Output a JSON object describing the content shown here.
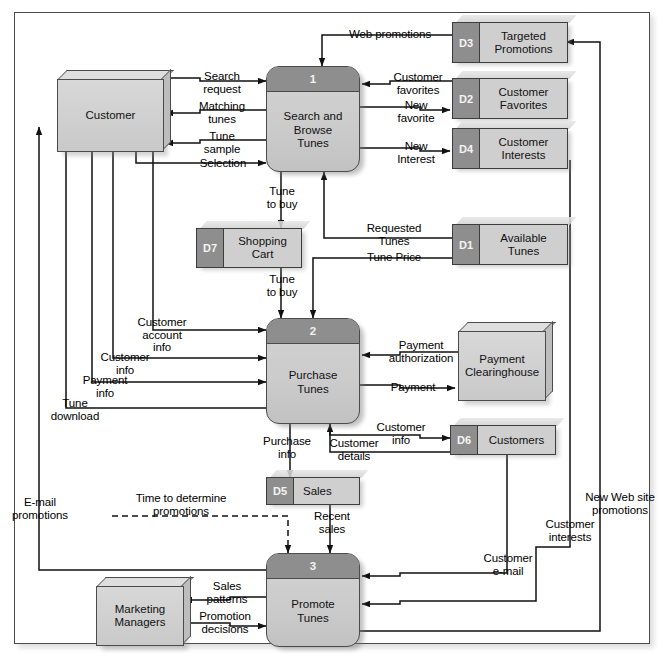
{
  "diagram": {
    "colors": {
      "process_header": "#8e8e8e",
      "process_body": "#cbcbcb",
      "datastore_id": "#8e8e8e",
      "datastore_body": "#cfcfcf",
      "entity_face": "#d0d0d0",
      "line": "#111111",
      "frame": "#4a4a4a"
    },
    "processes": [
      {
        "id": "1",
        "number": "1",
        "name": "Search and\nBrowse\nTunes"
      },
      {
        "id": "2",
        "number": "2",
        "name": "Purchase\nTunes"
      },
      {
        "id": "3",
        "number": "3",
        "name": "Promote\nTunes"
      }
    ],
    "data_stores": [
      {
        "id": "D3",
        "name": "Targeted\nPromotions"
      },
      {
        "id": "D2",
        "name": "Customer\nFavorites"
      },
      {
        "id": "D4",
        "name": "Customer\nInterests"
      },
      {
        "id": "D1",
        "name": "Available\nTunes"
      },
      {
        "id": "D7",
        "name": "Shopping\nCart"
      },
      {
        "id": "D6",
        "name": "Customers"
      },
      {
        "id": "D5",
        "name": "Sales"
      }
    ],
    "external_entities": [
      {
        "id": "customer",
        "name": "Customer"
      },
      {
        "id": "payment-clearinghouse",
        "name": "Payment\nClearinghouse"
      },
      {
        "id": "marketing-managers",
        "name": "Marketing\nManagers"
      }
    ],
    "flows": [
      {
        "id": "web-promotions",
        "label": "Web promotions"
      },
      {
        "id": "search-request",
        "label": "Search\nrequest"
      },
      {
        "id": "matching-tunes",
        "label": "Matching\ntunes"
      },
      {
        "id": "tune-sample",
        "label": "Tune\nsample"
      },
      {
        "id": "selection",
        "label": "Selection"
      },
      {
        "id": "customer-favorites",
        "label": "Customer\nfavorites"
      },
      {
        "id": "new-favorite",
        "label": "New\nfavorite"
      },
      {
        "id": "new-interest",
        "label": "New\nInterest"
      },
      {
        "id": "tune-to-buy-1",
        "label": "Tune\nto buy"
      },
      {
        "id": "requested-tunes",
        "label": "Requested\nTunes"
      },
      {
        "id": "tune-price",
        "label": "Tune Price"
      },
      {
        "id": "tune-to-buy-2",
        "label": "Tune\nto buy"
      },
      {
        "id": "customer-account-info",
        "label": "Customer\naccount\ninfo"
      },
      {
        "id": "customer-info-left",
        "label": "Customer\ninfo"
      },
      {
        "id": "payment-info",
        "label": "Payment\ninfo"
      },
      {
        "id": "tune-download",
        "label": "Tune\ndownload"
      },
      {
        "id": "payment-authorization",
        "label": "Payment\nauthorization"
      },
      {
        "id": "payment",
        "label": "Payment"
      },
      {
        "id": "customer-info-right",
        "label": "Customer\ninfo"
      },
      {
        "id": "customer-details",
        "label": "Customer\ndetails"
      },
      {
        "id": "purchase-info",
        "label": "Purchase\ninfo"
      },
      {
        "id": "time-to-determine",
        "label": "Time to determine\npromotions"
      },
      {
        "id": "recent-sales",
        "label": "Recent\nsales"
      },
      {
        "id": "email-promotions",
        "label": "E-mail\npromotions"
      },
      {
        "id": "sales-patterns",
        "label": "Sales\npatterns"
      },
      {
        "id": "promotion-decisions",
        "label": "Promotion\ndecisions"
      },
      {
        "id": "customer-email",
        "label": "Customer\ne-mail"
      },
      {
        "id": "customer-interests",
        "label": "Customer\ninterests"
      },
      {
        "id": "new-web-site-promotions",
        "label": "New Web site\npromotions"
      }
    ]
  }
}
